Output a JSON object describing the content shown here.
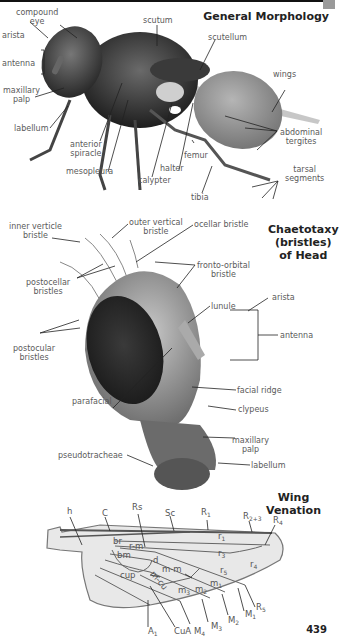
{
  "page": {
    "number": "439"
  },
  "sections": {
    "morphology": {
      "title": "General Morphology",
      "labels": {
        "compound_eye": "compound\neye",
        "arista": "arista",
        "antenna": "antenna",
        "maxillary_palp": "maxillary\npalp",
        "labellum": "labellum",
        "scutum": "scutum",
        "scutellum": "scutellum",
        "wings": "wings",
        "abdominal_tergites": "abdominal\ntergites",
        "anterior_spiracle": "anterior\nspiracle",
        "mesopleura": "mesopleura",
        "calypter": "calypter",
        "halter": "halter",
        "femur": "femur",
        "tibia": "tibia",
        "tarsal_segments": "tarsal\nsegments"
      }
    },
    "chaetotaxy": {
      "title": "Chaetotaxy\n(bristles)\nof Head",
      "labels": {
        "inner_verticle_bristle": "inner verticle\nbristle",
        "outer_vertical_bristle": "outer vertical\nbristle",
        "ocellar_bristle": "ocellar bristle",
        "fronto_orbital_bristle": "fronto-orbital\nbristle",
        "postocellar_bristles": "postocellar\nbristles",
        "postocular_bristles": "postocular\nbristles",
        "lunule": "lunule",
        "arista": "arista",
        "antenna": "antenna",
        "parafacial": "parafacial",
        "facial_ridge": "facial ridge",
        "clypeus": "clypeus",
        "maxillary_palp": "maxillary\npalp",
        "pseudotracheae": "pseudotracheae",
        "labellum": "labellum"
      }
    },
    "wing": {
      "title": "Wing Venation",
      "veins": [
        "h",
        "C",
        "Rs",
        "Sc",
        "R1",
        "R2+3",
        "R4",
        "R5",
        "M1",
        "M2",
        "M3",
        "M4",
        "CuA",
        "A1",
        "r-m",
        "m-m",
        "m-cu"
      ],
      "cells": [
        "br",
        "bm",
        "cup",
        "d",
        "r1",
        "r3",
        "r4",
        "r5",
        "m1",
        "m2",
        "m3"
      ]
    }
  }
}
